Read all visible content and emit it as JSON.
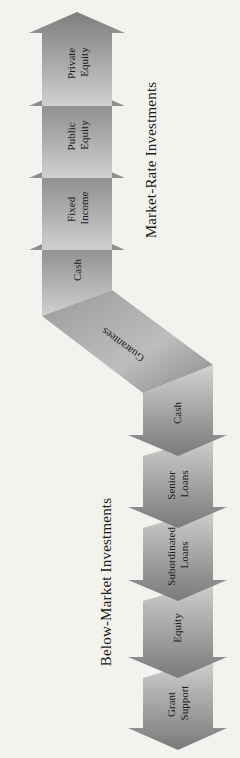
{
  "diagram": {
    "colors": {
      "background": "#f3f2ee",
      "arrow_dark": "#7d7d7d",
      "arrow_light": "#d2d2d2",
      "text": "#1a1a1a"
    },
    "market_rate": {
      "label": "Market-Rate Investments",
      "direction": "up",
      "arrows": [
        {
          "line1": "Private",
          "line2": "Equity"
        },
        {
          "line1": "Public",
          "line2": "Equity"
        },
        {
          "line1": "Fixed",
          "line2": "Income"
        },
        {
          "line1": "Cash",
          "line2": ""
        }
      ]
    },
    "bridge": {
      "label": "Guarantees"
    },
    "below_market": {
      "label": "Below-Market Investments",
      "direction": "down",
      "arrows": [
        {
          "line1": "Cash",
          "line2": ""
        },
        {
          "line1": "Senior",
          "line2": "Loans"
        },
        {
          "line1": "Subordinated",
          "line2": "Loans"
        },
        {
          "line1": "Equity",
          "line2": ""
        },
        {
          "line1": "Grant",
          "line2": "Support"
        }
      ]
    }
  }
}
